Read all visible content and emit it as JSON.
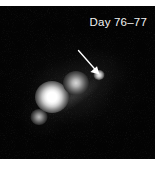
{
  "figure": {
    "kind": "astronomical-observation-frame",
    "background_color": "#030303",
    "margin_color": "#ffffff",
    "annotation_color": "#ffffff"
  },
  "labels": {
    "day_label": "Day 76–77"
  },
  "annotations": {
    "arrow": {
      "name": "pointer-arrow",
      "color": "#ffffff",
      "direction": "down-right",
      "tail_x": 79,
      "tail_y": 45,
      "tip_x": 98,
      "tip_y": 68,
      "points_at": "marked-source"
    }
  },
  "sources": [
    {
      "id": "source-marked",
      "label": "arrowed source",
      "x": 99,
      "y": 69,
      "brightness": "faint-point",
      "peak_color": "#f2f2f2"
    },
    {
      "id": "source-middle",
      "label": "middle knot",
      "x": 76,
      "y": 77,
      "brightness": "moderate-extended",
      "peak_color": "#d8d8d8"
    },
    {
      "id": "source-primary",
      "label": "brightest knot",
      "x": 52,
      "y": 91,
      "brightness": "saturated-bright",
      "peak_color": "#ffffff"
    },
    {
      "id": "source-faint-sw",
      "label": "south-west faint knot",
      "x": 39,
      "y": 111,
      "brightness": "faint",
      "peak_color": "#bdbdbd"
    }
  ]
}
